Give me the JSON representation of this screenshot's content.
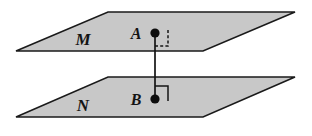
{
  "figure": {
    "background_color": "#ffffff",
    "canvas": {
      "width": 312,
      "height": 136
    },
    "colors": {
      "plane_fill": "#c8c8c8",
      "plane_stroke": "#1a1a1a",
      "line": "#141414",
      "text": "#141414",
      "dot": "#0d0d0d"
    },
    "planes": [
      {
        "id": "plane-m",
        "label": "M",
        "label_position": {
          "x": 83,
          "y": 45
        },
        "points": "16,51 108,12 295,12 203,51",
        "fill": "#c8c8c8",
        "stroke": "#1a1a1a",
        "stroke_width": 1.6
      },
      {
        "id": "plane-n",
        "label": "N",
        "label_position": {
          "x": 83,
          "y": 111
        },
        "points": "16,117 108,77 295,77 203,117",
        "fill": "#c8c8c8",
        "stroke": "#1a1a1a",
        "stroke_width": 1.6
      }
    ],
    "points": [
      {
        "id": "point-a",
        "label": "A",
        "label_position": {
          "x": 136,
          "y": 39
        },
        "dot": {
          "cx": 155,
          "cy": 33,
          "r": 4.6
        }
      },
      {
        "id": "point-b",
        "label": "B",
        "label_position": {
          "x": 136,
          "y": 105
        },
        "dot": {
          "cx": 155,
          "cy": 99,
          "r": 4.6
        }
      }
    ],
    "segment": {
      "id": "segment-ab",
      "from": "A",
      "to": "B",
      "x1": 155,
      "y1": 33,
      "x2": 155,
      "y2": 99,
      "stroke_width": 1.7
    },
    "angle_markers": [
      {
        "id": "right-angle-at-a",
        "style": "dashed",
        "measure": "90",
        "path": "M 155 46 L 168 46 L 168 28",
        "stroke_width": 1.5,
        "dash": "3,2.2"
      },
      {
        "id": "right-angle-at-b",
        "style": "solid",
        "measure": "90",
        "path": "M 155 86 L 168 86 L 168 101",
        "stroke_width": 1.5,
        "dash": "none"
      }
    ]
  }
}
